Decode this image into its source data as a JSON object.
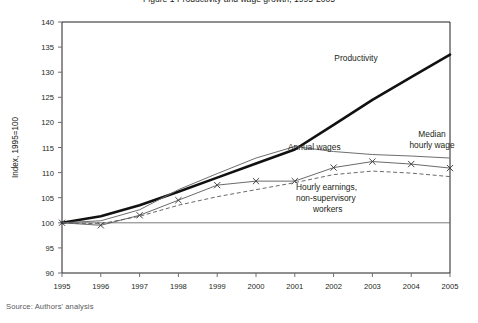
{
  "figure": {
    "title_clipped": "Figure 1  Productivity and wage growth, 1995-2005",
    "source": "Source: Authors' analysis"
  },
  "chart_data": {
    "type": "line",
    "title": "",
    "xlabel": "",
    "ylabel": "Index, 1995=100",
    "ylim": [
      90,
      140
    ],
    "ytick_step": 5,
    "yticks": [
      90,
      95,
      100,
      105,
      110,
      115,
      120,
      125,
      130,
      135,
      140
    ],
    "xlim": [
      1995,
      2005
    ],
    "x": [
      1995,
      1996,
      1997,
      1998,
      1999,
      2000,
      2001,
      2002,
      2003,
      2004,
      2005
    ],
    "categories": [
      "1995",
      "1996",
      "1997",
      "1998",
      "1999",
      "2000",
      "2001",
      "2002",
      "2003",
      "2004",
      "2005"
    ],
    "grid": false,
    "legend_position": "inline-annotations",
    "reference_line": 100,
    "series": [
      {
        "name": "Productivity",
        "style": "solid-heavy",
        "color": "#111111",
        "markers": false,
        "values": [
          100.0,
          101.3,
          103.5,
          106.2,
          109.0,
          111.8,
          114.6,
          119.5,
          124.5,
          129.0,
          133.5
        ]
      },
      {
        "name": "Annual wages",
        "style": "solid-thin",
        "color": "#6d6e71",
        "markers": false,
        "values": [
          100.0,
          100.4,
          102.6,
          106.6,
          109.8,
          112.9,
          115.2,
          114.2,
          113.6,
          113.3,
          112.9
        ]
      },
      {
        "name": "Median hourly wage",
        "style": "solid-thin-marker",
        "color": "#58595b",
        "markers": true,
        "marker_shape": "x",
        "values": [
          100.0,
          99.5,
          101.5,
          104.5,
          107.5,
          108.3,
          108.3,
          111.0,
          112.2,
          111.7,
          110.9
        ]
      },
      {
        "name": "Hourly earnings, non-supervisory workers",
        "style": "dashed",
        "color": "#58595b",
        "markers": false,
        "values": [
          100.0,
          99.8,
          101.3,
          103.5,
          105.2,
          106.6,
          108.0,
          109.6,
          110.3,
          109.9,
          109.2
        ]
      }
    ],
    "annotations": [
      {
        "id": "productivity",
        "text": "Productivity",
        "x_px": 356,
        "y_px": 61,
        "anchor": "middle"
      },
      {
        "id": "annual-wages",
        "text": "Annual wages",
        "x_px": 288,
        "y_px": 150,
        "anchor": "start"
      },
      {
        "id": "median-hourly-wage-l1",
        "text": "Median",
        "x_px": 432,
        "y_px": 137,
        "anchor": "middle"
      },
      {
        "id": "median-hourly-wage-l2",
        "text": "hourly wage",
        "x_px": 432,
        "y_px": 148,
        "anchor": "middle"
      },
      {
        "id": "hourly-earnings-l1",
        "text": "Hourly earnings,",
        "x_px": 296,
        "y_px": 190,
        "anchor": "start"
      },
      {
        "id": "hourly-earnings-l2",
        "text": "non-supervisory",
        "x_px": 296,
        "y_px": 201,
        "anchor": "start"
      },
      {
        "id": "hourly-earnings-l3",
        "text": "workers",
        "x_px": 313,
        "y_px": 212,
        "anchor": "start"
      }
    ]
  }
}
